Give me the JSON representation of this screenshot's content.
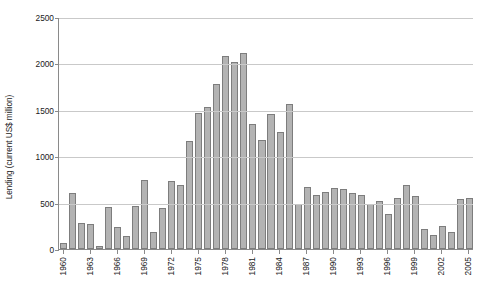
{
  "chart_data": {
    "type": "bar",
    "title": "",
    "subtitle": "",
    "xlabel": "",
    "ylabel": "Lending (current US$ million)",
    "ylim": [
      0,
      2500
    ],
    "yticks": [
      0,
      500,
      1000,
      1500,
      2000,
      2500
    ],
    "ytick_labels": [
      "0",
      "500",
      "1000",
      "1500",
      "2000",
      "2500"
    ],
    "grid": true,
    "legend": null,
    "legend_position": "none",
    "bar_color": "#b3b3b3",
    "bar_border_color": "#7d7d7d",
    "gridline_color": "#c9c9c9",
    "axis_color": "#8a8a8a",
    "xtick_labels": [
      "1960",
      "1963",
      "1966",
      "1969",
      "1972",
      "1975",
      "1978",
      "1981",
      "1984",
      "1987",
      "1990",
      "1993",
      "1996",
      "1999",
      "2002",
      "2005"
    ],
    "xtick_interval": 3,
    "categories": [
      "1960",
      "1961",
      "1962",
      "1963",
      "1964",
      "1965",
      "1966",
      "1967",
      "1968",
      "1969",
      "1970",
      "1971",
      "1972",
      "1973",
      "1974",
      "1975",
      "1976",
      "1977",
      "1978",
      "1979",
      "1980",
      "1981",
      "1982",
      "1983",
      "1984",
      "1985",
      "1986",
      "1987",
      "1988",
      "1989",
      "1990",
      "1991",
      "1992",
      "1993",
      "1994",
      "1995",
      "1996",
      "1997",
      "1998",
      "1999",
      "2000",
      "2001",
      "2002",
      "2003",
      "2004",
      "2005"
    ],
    "values": [
      70,
      600,
      285,
      265,
      35,
      455,
      240,
      135,
      465,
      745,
      180,
      445,
      735,
      690,
      1165,
      1465,
      1525,
      1775,
      2085,
      2010,
      2110,
      1350,
      1180,
      1460,
      1265,
      1560,
      480,
      665,
      585,
      610,
      660,
      650,
      600,
      580,
      490,
      520,
      375,
      555,
      685,
      575,
      215,
      155,
      250,
      180,
      540,
      555
    ]
  }
}
